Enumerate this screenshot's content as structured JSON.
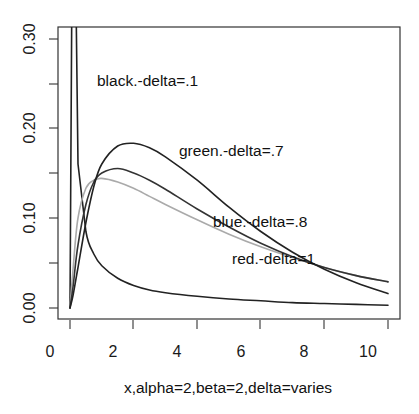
{
  "chart_data": {
    "type": "line",
    "title": "",
    "xlabel": "x,alpha=2,beta=2,delta=varies",
    "ylabel": "",
    "xlim": [
      0,
      10
    ],
    "ylim": [
      0,
      0.31
    ],
    "x_ticks": [
      "0",
      "2",
      "4",
      "6",
      "8",
      "10"
    ],
    "y_ticks": [
      "0.00",
      "0.10",
      "0.20",
      "0.30"
    ],
    "grid": false,
    "x": [
      0,
      0.1,
      0.25,
      0.5,
      0.75,
      1,
      1.5,
      2,
      2.5,
      3,
      4,
      5,
      6,
      7,
      8,
      9,
      10
    ],
    "series": [
      {
        "name": "black.-delta=.1",
        "color": "#222222",
        "values": [
          0,
          0.6,
          0.16,
          0.085,
          0.06,
          0.047,
          0.033,
          0.025,
          0.02,
          0.017,
          0.013,
          0.01,
          0.008,
          0.006,
          0.005,
          0.004,
          0.003
        ]
      },
      {
        "name": "green.-delta=.7",
        "color": "#222222",
        "values": [
          0,
          0.015,
          0.045,
          0.095,
          0.135,
          0.16,
          0.18,
          0.183,
          0.178,
          0.168,
          0.142,
          0.112,
          0.085,
          0.062,
          0.043,
          0.028,
          0.016
        ]
      },
      {
        "name": "blue.-delta=.8",
        "color": "#333333",
        "values": [
          0,
          0.025,
          0.07,
          0.115,
          0.14,
          0.15,
          0.155,
          0.15,
          0.142,
          0.132,
          0.11,
          0.09,
          0.072,
          0.057,
          0.045,
          0.036,
          0.029
        ]
      },
      {
        "name": "red.-delta=1",
        "color": "#aaaaaa",
        "values": [
          0,
          0.045,
          0.1,
          0.133,
          0.142,
          0.144,
          0.14,
          0.133,
          0.124,
          0.115,
          0.098,
          0.082,
          0.068,
          0.056,
          0.045,
          0.036,
          0.029
        ]
      }
    ],
    "annotations": [
      {
        "text": "black.-delta=.1",
        "x": 1.0,
        "y": 0.25
      },
      {
        "text": "green.-delta=.7",
        "x": 3.9,
        "y": 0.18
      },
      {
        "text": "blue.-delta=.8",
        "x": 5.2,
        "y": 0.125
      },
      {
        "text": "red.-delta=1",
        "x": 5.8,
        "y": 0.105
      }
    ],
    "legend_position": "none"
  }
}
